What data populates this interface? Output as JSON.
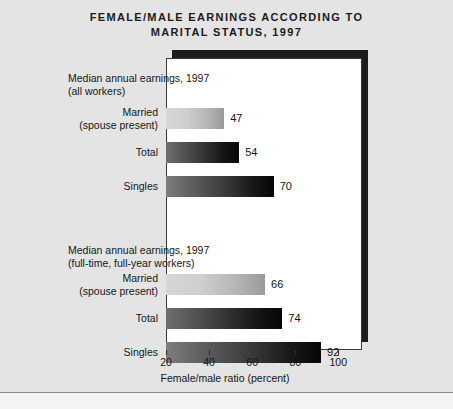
{
  "title": {
    "line1": "FEMALE/MALE EARNINGS ACCORDING TO",
    "line2": "MARITAL STATUS, 1997"
  },
  "axis_title": "Female/male ratio (percent)",
  "colors": {
    "background": "#e4e4e4",
    "plot_background": "#ffffff",
    "plot_border": "#3a3a3a",
    "shadow": "#1d1d1d",
    "text": "#161616",
    "bar_light": "#d6d6d6",
    "bar_dark": "#141414"
  },
  "groups": [
    {
      "caption_line1": "Median annual earnings, 1997",
      "caption_line2": "(all workers)",
      "rows": [
        {
          "label_line1": "Married",
          "label_line2": "(spouse present)",
          "value": 47,
          "value_text": "47",
          "style": "light"
        },
        {
          "label_line1": "Total",
          "label_line2": "",
          "value": 54,
          "value_text": "54",
          "style": "dark"
        },
        {
          "label_line1": "Singles",
          "label_line2": "",
          "value": 70,
          "value_text": "70",
          "style": "dark2"
        }
      ]
    },
    {
      "caption_line1": "Median annual earnings, 1997",
      "caption_line2": "(full-time, full-year workers)",
      "rows": [
        {
          "label_line1": "Married",
          "label_line2": "(spouse present)",
          "value": 66,
          "value_text": "66",
          "style": "light"
        },
        {
          "label_line1": "Total",
          "label_line2": "",
          "value": 74,
          "value_text": "74",
          "style": "dark"
        },
        {
          "label_line1": "Singles",
          "label_line2": "",
          "value": 92,
          "value_text": "92",
          "style": "dark2"
        }
      ]
    }
  ],
  "axis": {
    "ticks": [
      20,
      40,
      60,
      80,
      100
    ],
    "tick_labels": [
      "20",
      "40",
      "60",
      "80",
      "100"
    ],
    "min": 20,
    "max": 111
  },
  "chart_data": {
    "type": "bar",
    "orientation": "horizontal",
    "title": "FEMALE/MALE EARNINGS ACCORDING TO MARITAL STATUS, 1997",
    "xlabel": "Female/male ratio (percent)",
    "ylabel": "",
    "xlim": [
      20,
      111
    ],
    "grid": false,
    "legend": "none",
    "panels": [
      {
        "annotation": "Median annual earnings, 1997 (all workers)",
        "categories": [
          "Married (spouse present)",
          "Total",
          "Singles"
        ],
        "values": [
          47,
          54,
          70
        ]
      },
      {
        "annotation": "Median annual earnings, 1997 (full-time, full-year workers)",
        "categories": [
          "Married (spouse present)",
          "Total",
          "Singles"
        ],
        "values": [
          66,
          74,
          92
        ]
      }
    ],
    "xticks": [
      20,
      40,
      60,
      80,
      100
    ],
    "xticklabels": [
      "20",
      "40",
      "60",
      "80",
      "100"
    ]
  }
}
